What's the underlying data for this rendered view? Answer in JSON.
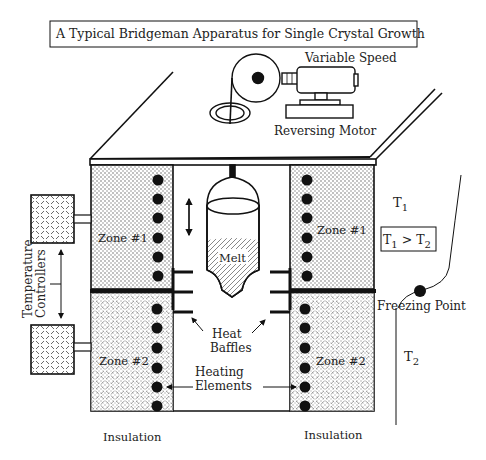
{
  "title": "A Typical Bridgeman Apparatus for Single Crystal Growth",
  "motor": {
    "label_top": "Variable Speed",
    "label_bottom": "Reversing Motor"
  },
  "zones": {
    "left_upper": "Zone #1",
    "right_upper": "Zone #1",
    "left_lower": "Zone #2",
    "right_lower": "Zone #2"
  },
  "crucible": {
    "label": "Melt"
  },
  "controllers": {
    "label_line1": "Temperature",
    "label_line2": "Controllers"
  },
  "baffles": {
    "label_line1": "Heat",
    "label_line2": "Baffles"
  },
  "heating": {
    "label_line1": "Heating",
    "label_line2": "Elements"
  },
  "insulation": {
    "left": "Insulation",
    "right": "Insulation"
  },
  "profile": {
    "t1": "T",
    "t1_sub": "1",
    "relation_a": "T",
    "relation_a_sub": "1",
    "relation_op": " > ",
    "relation_b": "T",
    "relation_b_sub": "2",
    "freezing_point": "Freezing Point",
    "t2": "T",
    "t2_sub": "2"
  },
  "colors": {
    "ink": "#111111",
    "text": "#222222",
    "background": "#ffffff"
  }
}
